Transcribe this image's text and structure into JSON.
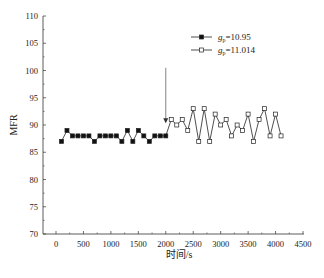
{
  "chart_data": {
    "type": "line",
    "title": "",
    "xlabel": "时间/s",
    "ylabel": "MFR",
    "xlim": [
      0,
      4500
    ],
    "ylim": [
      70,
      110
    ],
    "xticks": [
      0,
      500,
      1000,
      1500,
      2000,
      2500,
      3000,
      3500,
      4000,
      4500
    ],
    "yticks": [
      70,
      75,
      80,
      85,
      90,
      95,
      100,
      105,
      110
    ],
    "grid": false,
    "legend_position": "upper right",
    "series": [
      {
        "name": "g_p=10.95",
        "label_main": "g",
        "label_sub": "p",
        "label_value": "=10.95",
        "marker": "filled-square",
        "x": [
          100,
          200,
          300,
          400,
          500,
          600,
          700,
          800,
          900,
          1000,
          1100,
          1200,
          1300,
          1400,
          1500,
          1600,
          1700,
          1800,
          1900,
          2000
        ],
        "values": [
          87,
          89,
          88,
          88,
          88,
          88,
          87,
          88,
          88,
          88,
          88,
          87,
          89,
          87,
          89,
          88,
          87,
          88,
          88,
          88
        ]
      },
      {
        "name": "g_p=11.014",
        "label_main": "g",
        "label_sub": "p",
        "label_value": "=11.014",
        "marker": "open-square",
        "x": [
          2100,
          2200,
          2300,
          2400,
          2500,
          2600,
          2700,
          2800,
          2900,
          3000,
          3100,
          3200,
          3300,
          3400,
          3500,
          3600,
          3700,
          3800,
          3900,
          4000,
          4100
        ],
        "values": [
          91,
          90,
          91,
          89,
          93,
          87,
          93,
          87,
          92,
          90,
          91,
          88,
          90,
          89,
          92,
          87,
          91,
          93,
          88,
          92,
          88
        ]
      }
    ],
    "annotations": [
      {
        "type": "arrow",
        "x": 2000,
        "y_from": 100.5,
        "y_to": 90.5,
        "description": "downward arrow marking switch point"
      }
    ]
  },
  "colors": {
    "line": "#222222",
    "axis": "#333333",
    "arrow": "#777777"
  }
}
